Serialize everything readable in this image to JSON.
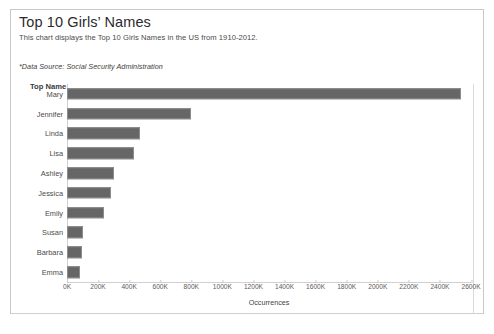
{
  "header": {
    "title": "Top 10 Girls’ Names",
    "subtitle": "This chart displays the Top 10 Girls Names in the US from 1910-2012.",
    "data_source": "*Data Source: Social Security Administration"
  },
  "axis_heading": "Top Name",
  "colors": {
    "bar": "#666666",
    "bar_border": "#8d8d8d",
    "frame": "#c8c8c8",
    "text": "#333333"
  },
  "chart_data": {
    "type": "bar",
    "orientation": "horizontal",
    "title": "Top 10 Girls’ Names",
    "subtitle": "This chart displays the Top 10 Girls Names in the US from 1910-2012.",
    "xlabel": "Occurrences",
    "ylabel": "Top Name",
    "grid": false,
    "legend": false,
    "xlim": [
      0,
      2600000
    ],
    "xtick_labels": [
      "0K",
      "200K",
      "400K",
      "600K",
      "800K",
      "1000K",
      "1200K",
      "1400K",
      "1600K",
      "1800K",
      "2000K",
      "2200K",
      "2400K",
      "2600K"
    ],
    "xtick_values": [
      0,
      200000,
      400000,
      600000,
      800000,
      1000000,
      1200000,
      1400000,
      1600000,
      1800000,
      2000000,
      2200000,
      2400000,
      2600000
    ],
    "categories": [
      "Mary",
      "Jennifer",
      "Linda",
      "Lisa",
      "Ashley",
      "Jessica",
      "Emily",
      "Susan",
      "Barbara",
      "Emma"
    ],
    "values": [
      2535000,
      795000,
      468000,
      430000,
      300000,
      285000,
      235000,
      100000,
      95000,
      85000
    ]
  }
}
